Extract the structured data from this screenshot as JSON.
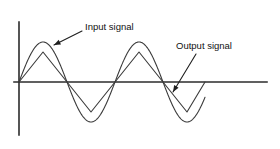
{
  "figure": {
    "title": "",
    "background_color": "#ffffff",
    "line_color": "#3a3a3a",
    "axis_color": "#2b2b2b",
    "text_color": "#111111",
    "annotations": [
      {
        "id": "input",
        "label": "Input signal",
        "text_x": 85,
        "text_y": 27,
        "leader_from_x": 82,
        "leader_from_y": 31,
        "leader_to_x": 54,
        "leader_to_y": 45
      },
      {
        "id": "output",
        "label": "Output signal",
        "text_x": 176,
        "text_y": 46,
        "leader_from_x": 196,
        "leader_from_y": 54,
        "leader_to_x": 173,
        "leader_to_y": 92
      }
    ],
    "axes": {
      "y_axis_x": 19,
      "y_axis_top": 22,
      "y_axis_bottom": 135,
      "x_axis_y": 82,
      "x_axis_left": 14,
      "x_axis_right": 267
    }
  },
  "chart_data": {
    "type": "line",
    "title": "",
    "xlabel": "",
    "ylabel": "",
    "grid": false,
    "legend_position": "inline-annotations",
    "baseline_y": 82,
    "period_px": 48,
    "zero_crossings_x": [
      19,
      67,
      115,
      163,
      205
    ],
    "xlim": [
      19,
      205
    ],
    "ylim": [
      -1,
      1
    ],
    "series": [
      {
        "name": "Input signal",
        "shape": "sine",
        "amplitude_px": 40,
        "description": "Smooth sinusoid, larger amplitude, two full cycles",
        "peaks": [
          {
            "x": 43,
            "y": 42,
            "sign": "positive"
          },
          {
            "x": 91,
            "y": 122,
            "sign": "negative"
          },
          {
            "x": 139,
            "y": 42,
            "sign": "positive"
          },
          {
            "x": 187,
            "y": 122,
            "sign": "negative"
          }
        ]
      },
      {
        "name": "Output signal",
        "shape": "triangle",
        "amplitude_px": 30,
        "description": "Peak-clipped / triangular wave, smaller amplitude, same zero crossings",
        "peaks": [
          {
            "x": 43,
            "y": 52,
            "sign": "positive"
          },
          {
            "x": 91,
            "y": 112,
            "sign": "negative"
          },
          {
            "x": 139,
            "y": 52,
            "sign": "positive"
          },
          {
            "x": 187,
            "y": 112,
            "sign": "negative"
          }
        ]
      }
    ]
  }
}
